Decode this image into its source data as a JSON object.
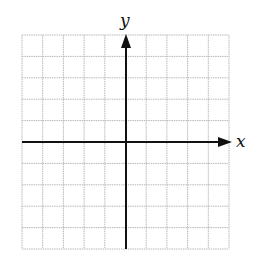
{
  "diagram": {
    "type": "coordinate-plane",
    "grid": {
      "columns": 10,
      "rows": 10,
      "left": 22,
      "top": 35,
      "right": 229,
      "bottom": 249,
      "line_color": "#b8b8b8",
      "line_style": "dotted"
    },
    "axes": {
      "color": "#111111",
      "origin": {
        "x": 126,
        "y": 142
      },
      "x_label": "x",
      "y_label": "y"
    }
  }
}
